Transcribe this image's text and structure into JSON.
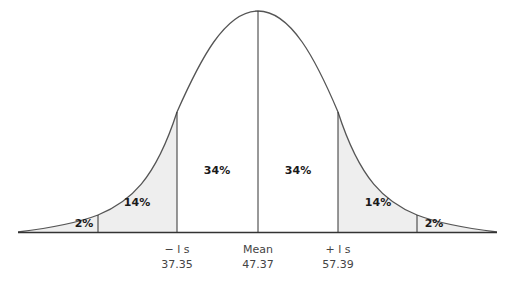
{
  "diagram": {
    "title": "",
    "type": "normal-distribution",
    "colors": {
      "curve": "#555555",
      "shade": "#eeeeee",
      "line": "#333333",
      "text": "#1a1a1a",
      "axis_text": "#444444"
    },
    "regions": [
      {
        "label": "2%",
        "position": "left-tail",
        "shaded": true
      },
      {
        "label": "14%",
        "position": "left-between-1s-2s",
        "shaded": true
      },
      {
        "label": "34%",
        "position": "left-of-mean",
        "shaded": false
      },
      {
        "label": "34%",
        "position": "right-of-mean",
        "shaded": false
      },
      {
        "label": "14%",
        "position": "right-between-1s-2s",
        "shaded": true
      },
      {
        "label": "2%",
        "position": "right-tail",
        "shaded": true
      }
    ],
    "axis_labels": [
      {
        "name": "-1s",
        "label": "− l s",
        "value": "37.35"
      },
      {
        "name": "mean",
        "label": "Mean",
        "value": "47.37"
      },
      {
        "name": "+1s",
        "label": "+ l s",
        "value": "57.39"
      }
    ]
  }
}
